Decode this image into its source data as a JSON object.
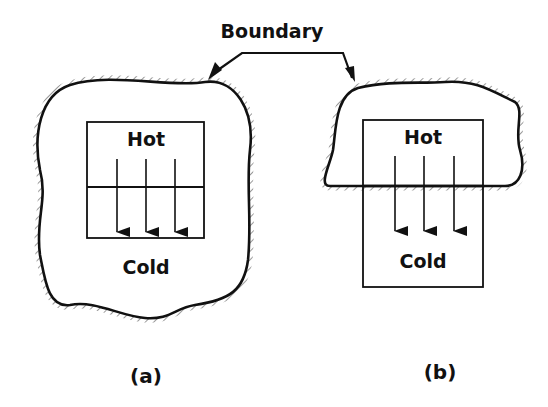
{
  "diagram": {
    "type": "thermodynamic-system-boundary",
    "pointer_label": "Boundary",
    "panels": [
      {
        "caption": "(a)",
        "hot_label": "Hot",
        "cold_label": "Cold",
        "description": "Boundary encloses both hot and cold regions"
      },
      {
        "caption": "(b)",
        "hot_label": "Hot",
        "cold_label": "Cold",
        "description": "Boundary encloses only the hot region; heat crosses boundary"
      }
    ],
    "colors": {
      "line": "#111111",
      "background": "#ffffff"
    }
  }
}
